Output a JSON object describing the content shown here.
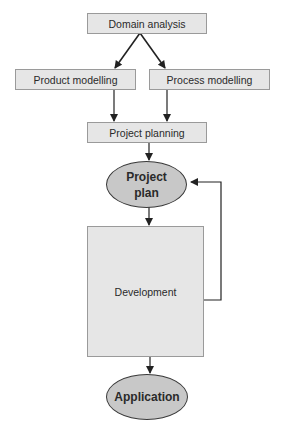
{
  "diagram": {
    "nodes": {
      "domain_analysis": {
        "label": "Domain analysis",
        "shape": "rect"
      },
      "product_modelling": {
        "label": "Product modelling",
        "shape": "rect"
      },
      "process_modelling": {
        "label": "Process modelling",
        "shape": "rect"
      },
      "project_planning": {
        "label": "Project planning",
        "shape": "rect"
      },
      "project_plan": {
        "label_line1": "Project",
        "label_line2": "plan",
        "shape": "ellipse"
      },
      "development": {
        "label": "Development",
        "shape": "rect"
      },
      "application": {
        "label": "Application",
        "shape": "ellipse"
      }
    },
    "edges": [
      {
        "from": "Domain analysis",
        "to": "Product modelling"
      },
      {
        "from": "Domain analysis",
        "to": "Process modelling"
      },
      {
        "from": "Product modelling",
        "to": "Project planning"
      },
      {
        "from": "Process modelling",
        "to": "Project planning"
      },
      {
        "from": "Project planning",
        "to": "Project plan"
      },
      {
        "from": "Project plan",
        "to": "Development"
      },
      {
        "from": "Development",
        "to": "Project plan",
        "type": "feedback"
      },
      {
        "from": "Development",
        "to": "Application"
      }
    ],
    "colors": {
      "rect_fill": "#e6e6e6",
      "rect_border": "#9a9a9a",
      "ellipse_fill": "#c8c8c8",
      "line": "#222222"
    }
  }
}
